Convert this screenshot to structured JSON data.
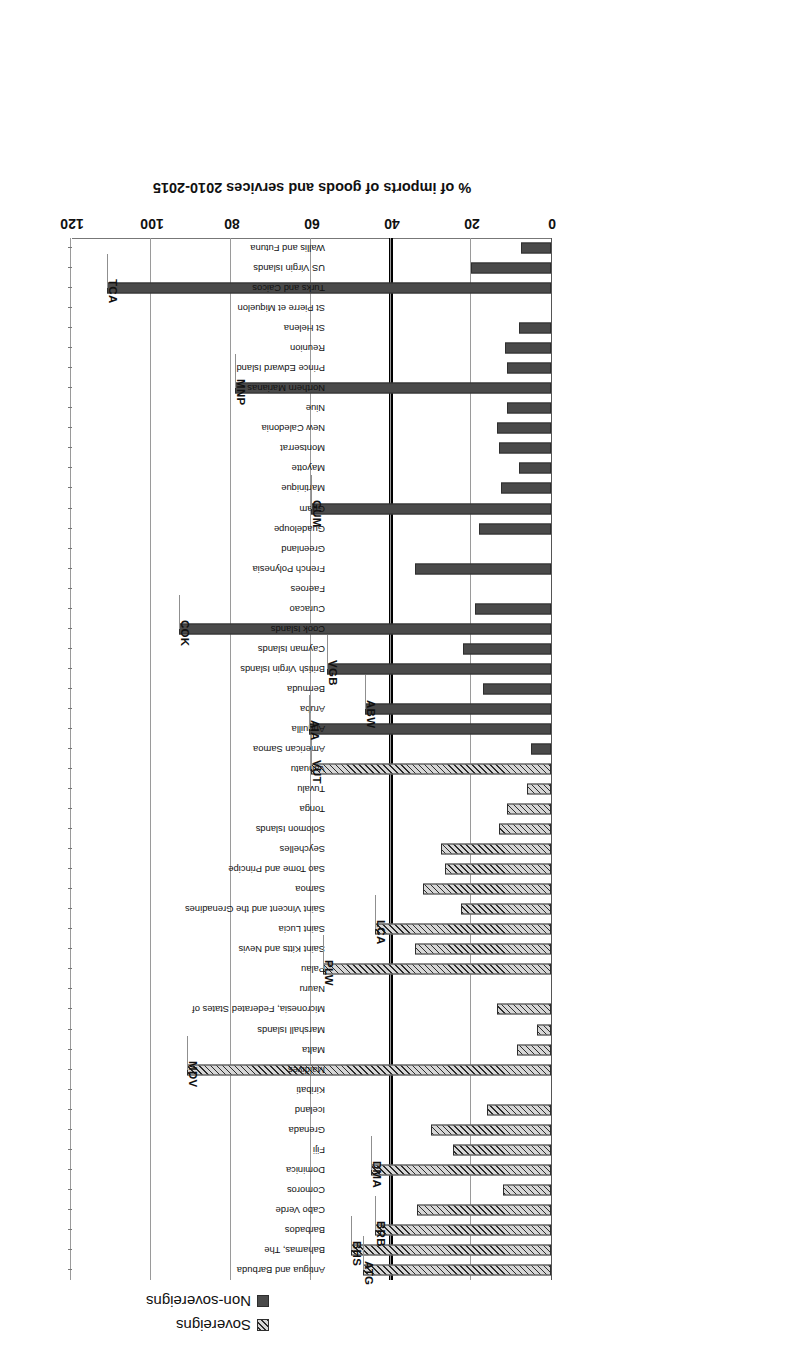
{
  "figure": {
    "rotation_degrees": 180,
    "note": "scanned figure appears upside-down"
  },
  "legend": {
    "position": "top",
    "entries": [
      {
        "label": "Sovereigns",
        "pattern": "diagonal-hatch",
        "color": "#d6d6d6"
      },
      {
        "label": "Non-sovereigns",
        "pattern": "solid",
        "color": "#4a4a4a"
      }
    ]
  },
  "axis": {
    "title": "% of imports of goods and services 2010-2015",
    "ticks": [
      "0",
      "20",
      "40",
      "60",
      "80",
      "100",
      "120"
    ],
    "min": 0,
    "max": 120
  },
  "threshold": {
    "value": 40,
    "color": "#000000",
    "label": ""
  },
  "chart_data": {
    "type": "bar",
    "orientation": "horizontal",
    "title": "",
    "xlabel": "% of imports of goods and services 2010-2015",
    "ylabel": "",
    "xlim": [
      0,
      120
    ],
    "grid": true,
    "legend_position": "top",
    "series": [
      {
        "name": "Sovereigns",
        "pattern": "diagonal-hatch",
        "color": "#d6d6d6"
      },
      {
        "name": "Non-sovereigns",
        "pattern": "solid",
        "color": "#4a4a4a"
      }
    ],
    "categories": [
      "Antigua and Barbuda",
      "Bahamas, The",
      "Barbados",
      "Cabo Verde",
      "Comoros",
      "Dominica",
      "Fiji",
      "Grenada",
      "Iceland",
      "Kiribati",
      "Maldives",
      "Malta",
      "Marshall Islands",
      "Micronesia, Federated States of",
      "Nauru",
      "Palau",
      "Saint Kitts and Nevis",
      "Saint Lucia",
      "Saint Vincent and the Grenadines",
      "Samoa",
      "Sao Tome and Principe",
      "Seychelles",
      "Solomon Islands",
      "Tonga",
      "Tuvalu",
      "Vanuatu",
      "American Samoa",
      "Anguilla",
      "Aruba",
      "Bermuda",
      "British Virgin Islands",
      "Cayman Islands",
      "Cook Islands",
      "Curacao",
      "Faeroes",
      "French Polynesia",
      "Greenland",
      "Guadeloupe",
      "Guam",
      "Martinique",
      "Mayotte",
      "Montserrat",
      "New Caledonia",
      "Niue",
      "Northern Marianas",
      "Prince Edward Island",
      "Reunion",
      "St Helena",
      "St Pierre et Miquelon",
      "Turks and Caicos",
      "US Virgin Islands",
      "Wallis and Futuna"
    ],
    "groups": [
      "Sovereigns",
      "Sovereigns",
      "Sovereigns",
      "Sovereigns",
      "Sovereigns",
      "Sovereigns",
      "Sovereigns",
      "Sovereigns",
      "Sovereigns",
      "Sovereigns",
      "Sovereigns",
      "Sovereigns",
      "Sovereigns",
      "Sovereigns",
      "Sovereigns",
      "Sovereigns",
      "Sovereigns",
      "Sovereigns",
      "Sovereigns",
      "Sovereigns",
      "Sovereigns",
      "Sovereigns",
      "Sovereigns",
      "Sovereigns",
      "Sovereigns",
      "Sovereigns",
      "Non-sovereigns",
      "Non-sovereigns",
      "Non-sovereigns",
      "Non-sovereigns",
      "Non-sovereigns",
      "Non-sovereigns",
      "Non-sovereigns",
      "Non-sovereigns",
      "Non-sovereigns",
      "Non-sovereigns",
      "Non-sovereigns",
      "Non-sovereigns",
      "Non-sovereigns",
      "Non-sovereigns",
      "Non-sovereigns",
      "Non-sovereigns",
      "Non-sovereigns",
      "Non-sovereigns",
      "Non-sovereigns",
      "Non-sovereigns",
      "Non-sovereigns",
      "Non-sovereigns",
      "Non-sovereigns",
      "Non-sovereigns",
      "Non-sovereigns",
      "Non-sovereigns"
    ],
    "values": [
      47,
      50,
      44,
      33.5,
      12,
      45,
      24.5,
      30,
      16,
      0,
      91,
      8.5,
      3.5,
      13.5,
      0,
      57,
      34,
      44,
      22.5,
      32,
      26.5,
      27.5,
      13,
      11,
      6,
      60,
      5,
      60.5,
      46.5,
      17,
      56,
      22,
      93,
      19,
      0,
      34,
      0,
      18,
      60,
      12.5,
      8,
      13,
      13.5,
      11,
      79,
      11,
      11.5,
      8,
      0,
      111,
      20,
      7.5
    ],
    "annotated_codes": [
      {
        "code": "ATG",
        "category": "Antigua and Barbuda"
      },
      {
        "code": "BHS",
        "category": "Bahamas, The"
      },
      {
        "code": "BRB",
        "category": "Barbados"
      },
      {
        "code": "DMA",
        "category": "Dominica"
      },
      {
        "code": "MDV",
        "category": "Maldives"
      },
      {
        "code": "PLW",
        "category": "Palau"
      },
      {
        "code": "LCA",
        "category": "Saint Lucia"
      },
      {
        "code": "VUT",
        "category": "Vanuatu"
      },
      {
        "code": "AIA",
        "category": "Anguilla"
      },
      {
        "code": "ABW",
        "category": "Aruba"
      },
      {
        "code": "VGB",
        "category": "British Virgin Islands"
      },
      {
        "code": "COK",
        "category": "Cook Islands"
      },
      {
        "code": "GUM",
        "category": "Guam"
      },
      {
        "code": "MNP",
        "category": "Northern Marianas"
      },
      {
        "code": "TCA",
        "category": "Turks and Caicos"
      }
    ]
  }
}
